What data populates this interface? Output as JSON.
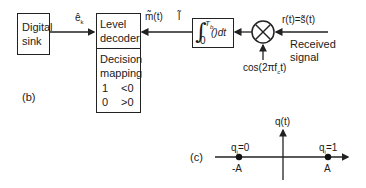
{
  "figure_b": {
    "label": "(b)",
    "blocks": {
      "digital_sink": {
        "line1": "Digital",
        "line2": "sink"
      },
      "level_decoder": {
        "line1": "Level",
        "line2": "decoder"
      },
      "decision_mapping": {
        "line1": "Decision",
        "line2": "mapping",
        "rows": [
          {
            "bit": "1",
            "condition": "<0"
          },
          {
            "bit": "0",
            "condition": ">0"
          }
        ]
      },
      "integrator": {
        "upper_limit": "T",
        "upper_sub": "b",
        "lower_limit": "0",
        "integrand": "()dt"
      },
      "multiplier": {
        "symbol": "×"
      }
    },
    "signals": {
      "e_hat": "ê",
      "e_sub": "k",
      "m_hat": "m̃(t)",
      "l_bar": "l̃",
      "r_of_t": "r(t)=s̃(t)",
      "received_1": "Received",
      "received_2": "signal",
      "carrier": "cos(2πf",
      "carrier_sub": "c",
      "carrier_end": "t)"
    }
  },
  "figure_c": {
    "label": "(c)",
    "y_axis_label": "q(t)",
    "points": [
      {
        "label": "q",
        "sub": "i",
        "value": "=0",
        "position": "-A"
      },
      {
        "label": "q",
        "sub": "i",
        "value": "=1",
        "position": "A"
      }
    ]
  }
}
